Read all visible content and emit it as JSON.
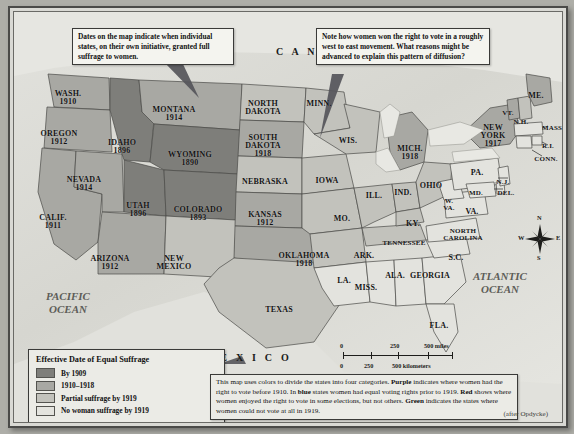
{
  "callouts": [
    {
      "id": "dates-note",
      "text": "Dates on the map indicate when individual states, on their own initiative, granted full suffrage to women."
    },
    {
      "id": "diffusion-note",
      "text": "Note how women won the right to vote in a roughly west to east movement. What reasons might be advanced to explain this pattern of diffusion?"
    }
  ],
  "legend": {
    "title": "Effective Date of Equal Suffrage",
    "items": [
      {
        "label": "By 1909",
        "color": "#7e7e7a"
      },
      {
        "label": "1910–1918",
        "color": "#a8a8a3"
      },
      {
        "label": "Partial suffrage by 1919",
        "color": "#c2c2bc"
      },
      {
        "label": "No woman suffrage by 1919",
        "color": "#e3e3de"
      }
    ]
  },
  "note": {
    "l1_a": "This map uses colors to divide the states into four categories. ",
    "l1_b": "Purple",
    "l2_a": " indicates where women had the right to vote before 1910. In ",
    "l2_b": "blue",
    "l2_c": " states women had equal voting rights prior to 1919. ",
    "l3_b": "Red",
    "l3_c": " shows where women enjoyed the right to vote in some elections, but not others. ",
    "l4_b": "Green",
    "l4_c": " indicates the states where women could not vote at all in 1919.",
    "credit": "(after Opdycke)"
  },
  "scale": {
    "miles_ticks": [
      "0",
      "250",
      "500 miles"
    ],
    "km_ticks": [
      "0",
      "250",
      "500 kilometers"
    ]
  },
  "compass": {
    "n": "N",
    "s": "S",
    "e": "E",
    "w": "W"
  },
  "geo_labels": {
    "canada": "C A N A D A",
    "mexico": "M E X I C O",
    "pacific": "PACIFIC\nOCEAN",
    "pacific_l1": "PACIFIC",
    "pacific_l2": "OCEAN",
    "atlantic_l1": "ATLANTIC",
    "atlantic_l2": "OCEAN"
  },
  "map_data": {
    "type": "choropleth",
    "title": "Effective Date of Equal Suffrage",
    "categories": [
      {
        "key": "by1909",
        "label": "By 1909",
        "color": "#7e7e7a"
      },
      {
        "key": "1910_18",
        "label": "1910–1918",
        "color": "#a8a8a3"
      },
      {
        "key": "partial",
        "label": "Partial suffrage by 1919",
        "color": "#c2c2bc"
      },
      {
        "key": "none",
        "label": "No woman suffrage by 1919",
        "color": "#e3e3de"
      }
    ],
    "states": [
      {
        "name": "WASH.",
        "year": "1910",
        "category": "1910_18",
        "x": 54,
        "y": 78,
        "size": "sz8"
      },
      {
        "name": "OREGON",
        "year": "1912",
        "category": "1910_18",
        "x": 45,
        "y": 118,
        "size": "sz8"
      },
      {
        "name": "IDAHO",
        "year": "1896",
        "category": "by1909",
        "x": 108,
        "y": 127,
        "size": "sz8"
      },
      {
        "name": "MONTANA",
        "year": "1914",
        "category": "1910_18",
        "x": 160,
        "y": 94,
        "size": "sz8"
      },
      {
        "name": "WYOMING",
        "year": "1890",
        "category": "by1909",
        "x": 176,
        "y": 139,
        "size": "sz8"
      },
      {
        "name": "NEVADA",
        "year": "1914",
        "category": "1910_18",
        "x": 70,
        "y": 164,
        "size": "sz8"
      },
      {
        "name": "UTAH",
        "year": "1896",
        "category": "by1909",
        "x": 124,
        "y": 190,
        "size": "sz8"
      },
      {
        "name": "COLORADO",
        "year": "1893",
        "category": "by1909",
        "x": 184,
        "y": 194,
        "size": "sz8"
      },
      {
        "name": "CALIF.",
        "year": "1911",
        "category": "1910_18",
        "x": 39,
        "y": 202,
        "size": "sz8"
      },
      {
        "name": "ARIZONA",
        "year": "1912",
        "category": "1910_18",
        "x": 96,
        "y": 243,
        "size": "sz8"
      },
      {
        "name": "NEW\nMEXICO",
        "year": "",
        "category": "partial",
        "x": 160,
        "y": 243,
        "size": "sz8"
      },
      {
        "name": "NORTH\nDAKOTA",
        "year": "",
        "category": "partial",
        "x": 249,
        "y": 88,
        "size": "sz8"
      },
      {
        "name": "SOUTH\nDAKOTA",
        "year": "1918",
        "category": "1910_18",
        "x": 249,
        "y": 122,
        "size": "sz8"
      },
      {
        "name": "NEBRASKA",
        "year": "",
        "category": "partial",
        "x": 251,
        "y": 166,
        "size": "sz8"
      },
      {
        "name": "KANSAS",
        "year": "1912",
        "category": "1910_18",
        "x": 251,
        "y": 199,
        "size": "sz8"
      },
      {
        "name": "OKLAHOMA",
        "year": "1918",
        "category": "1910_18",
        "x": 290,
        "y": 240,
        "size": "sz8"
      },
      {
        "name": "TEXAS",
        "year": "",
        "category": "partial",
        "x": 265,
        "y": 294,
        "size": "sz8"
      },
      {
        "name": "MINN.",
        "year": "",
        "category": "partial",
        "x": 305,
        "y": 88,
        "size": "sz8"
      },
      {
        "name": "WIS.",
        "year": "",
        "category": "partial",
        "x": 334,
        "y": 125,
        "size": "sz8"
      },
      {
        "name": "IOWA",
        "year": "",
        "category": "partial",
        "x": 313,
        "y": 165,
        "size": "sz8"
      },
      {
        "name": "MO.",
        "year": "",
        "category": "partial",
        "x": 328,
        "y": 203,
        "size": "sz8"
      },
      {
        "name": "ILL.",
        "year": "",
        "category": "partial",
        "x": 360,
        "y": 180,
        "size": "sz8"
      },
      {
        "name": "IND.",
        "year": "",
        "category": "partial",
        "x": 389,
        "y": 177,
        "size": "sz8"
      },
      {
        "name": "MICH.",
        "year": "1918",
        "category": "1910_18",
        "x": 396,
        "y": 133,
        "size": "sz8"
      },
      {
        "name": "OHIO",
        "year": "",
        "category": "partial",
        "x": 417,
        "y": 170,
        "size": "sz8"
      },
      {
        "name": "KY.",
        "year": "",
        "category": "partial",
        "x": 399,
        "y": 208,
        "size": "sz8"
      },
      {
        "name": "TENNESSEE",
        "year": "",
        "category": "partial",
        "x": 390,
        "y": 228,
        "size": "sz7"
      },
      {
        "name": "ARK.",
        "year": "",
        "category": "partial",
        "x": 350,
        "y": 240,
        "size": "sz8"
      },
      {
        "name": "MISS.",
        "year": "",
        "category": "none",
        "x": 352,
        "y": 272,
        "size": "sz8"
      },
      {
        "name": "LA.",
        "year": "",
        "category": "none",
        "x": 330,
        "y": 265,
        "size": "sz8"
      },
      {
        "name": "ALA.",
        "year": "",
        "category": "none",
        "x": 381,
        "y": 260,
        "size": "sz8"
      },
      {
        "name": "GEORGIA",
        "year": "",
        "category": "none",
        "x": 416,
        "y": 260,
        "size": "sz8"
      },
      {
        "name": "FLA.",
        "year": "",
        "category": "none",
        "x": 425,
        "y": 310,
        "size": "sz8"
      },
      {
        "name": "S.C.",
        "year": "",
        "category": "none",
        "x": 442,
        "y": 242,
        "size": "sz8"
      },
      {
        "name": "NORTH\nCAROLINA",
        "year": "",
        "category": "none",
        "x": 449,
        "y": 216,
        "size": "sz7"
      },
      {
        "name": "VA.",
        "year": "",
        "category": "none",
        "x": 458,
        "y": 196,
        "size": "sz8"
      },
      {
        "name": "W.\nVA.",
        "year": "",
        "category": "none",
        "x": 435,
        "y": 186,
        "size": "sz7"
      },
      {
        "name": "PA.",
        "year": "",
        "category": "none",
        "x": 463,
        "y": 157,
        "size": "sz8"
      },
      {
        "name": "MD.",
        "year": "",
        "category": "none",
        "x": 462,
        "y": 178,
        "size": "sz7"
      },
      {
        "name": "DEL.",
        "year": "",
        "category": "none",
        "x": 492,
        "y": 178,
        "size": "sz7"
      },
      {
        "name": "N.J.",
        "year": "",
        "category": "none",
        "x": 489,
        "y": 167,
        "size": "sz7"
      },
      {
        "name": "NEW\nYORK",
        "year": "1917",
        "category": "1910_18",
        "x": 479,
        "y": 112,
        "size": "sz8"
      },
      {
        "name": "VT.",
        "year": "",
        "category": "partial",
        "x": 494,
        "y": 98,
        "size": "sz7"
      },
      {
        "name": "N.H.",
        "year": "",
        "category": "partial",
        "x": 507,
        "y": 107,
        "size": "sz7"
      },
      {
        "name": "ME.",
        "year": "",
        "category": "partial",
        "x": 522,
        "y": 80,
        "size": "sz8"
      },
      {
        "name": "MASS.",
        "year": "",
        "category": "none",
        "x": 539,
        "y": 113,
        "size": "sz7"
      },
      {
        "name": "R.I.",
        "year": "",
        "category": "none",
        "x": 534,
        "y": 131,
        "size": "sz7"
      },
      {
        "name": "CONN.",
        "year": "",
        "category": "none",
        "x": 532,
        "y": 144,
        "size": "sz7"
      }
    ]
  }
}
